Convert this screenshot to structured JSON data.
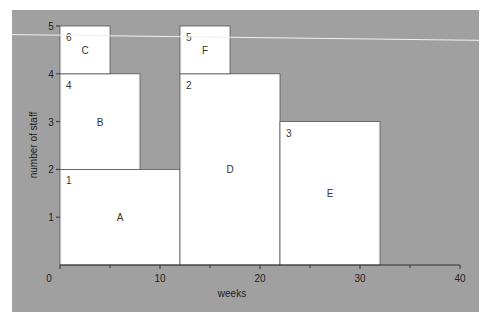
{
  "chart_data": {
    "type": "bar",
    "subtype": "staff-allocation-blocks",
    "title": "",
    "xlabel": "weeks",
    "ylabel": "number of staff",
    "xlim": [
      0,
      40
    ],
    "ylim": [
      0,
      5
    ],
    "xticks": [
      0,
      10,
      20,
      30,
      40
    ],
    "xminor_ticks": [
      5,
      15,
      25,
      35
    ],
    "yticks": [
      1,
      2,
      3,
      4,
      5
    ],
    "grid": false,
    "legend": null,
    "blocks": [
      {
        "name": "A",
        "order": "1",
        "x0": 0,
        "x1": 12,
        "y0": 0,
        "y1": 2
      },
      {
        "name": "B",
        "order": "4",
        "x0": 0,
        "x1": 8,
        "y0": 2,
        "y1": 4
      },
      {
        "name": "C",
        "order": "6",
        "x0": 0,
        "x1": 5,
        "y0": 4,
        "y1": 5
      },
      {
        "name": "D",
        "order": "2",
        "x0": 12,
        "x1": 22,
        "y0": 0,
        "y1": 4
      },
      {
        "name": "E",
        "order": "3",
        "x0": 22,
        "x1": 32,
        "y0": 0,
        "y1": 3
      },
      {
        "name": "F",
        "order": "5",
        "x0": 12,
        "x1": 17,
        "y0": 4,
        "y1": 5
      }
    ],
    "annotations": [
      {
        "type": "line",
        "description": "thin white near-horizontal line",
        "x_start": -1.2,
        "y_start": 4.82,
        "x_end": 41.8,
        "y_end": 4.7
      }
    ]
  },
  "colors": {
    "panel_background": "#a0a0a0",
    "block_fill": "#ffffff",
    "block_edge": "#555555",
    "axis": "#333333",
    "annotation_line": "#f0f0f0"
  }
}
